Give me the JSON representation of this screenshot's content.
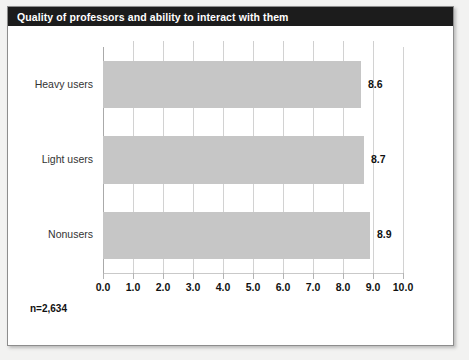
{
  "title": "Quality of professors and ability to interact with them",
  "footnote": "n=2,634",
  "colors": {
    "title_bar_bg": "#1c1c1c",
    "title_text": "#ffffff",
    "bar_fill": "#c6c6c6",
    "gridline": "#d2d2d2",
    "card_bg": "#ffffff",
    "page_bg": "#f2f2f1"
  },
  "chart_data": {
    "type": "bar",
    "orientation": "horizontal",
    "title": "Quality of professors and ability to interact with them",
    "categories": [
      "Heavy users",
      "Light users",
      "Nonusers"
    ],
    "values": [
      8.6,
      8.7,
      8.9
    ],
    "value_labels": [
      "8.6",
      "8.7",
      "8.9"
    ],
    "xlabel": "",
    "ylabel": "",
    "xlim": [
      0.0,
      10.0
    ],
    "xticks": [
      0.0,
      1.0,
      2.0,
      3.0,
      4.0,
      5.0,
      6.0,
      7.0,
      8.0,
      9.0,
      10.0
    ],
    "xtick_labels": [
      "0.0",
      "1.0",
      "2.0",
      "3.0",
      "4.0",
      "5.0",
      "6.0",
      "7.0",
      "8.0",
      "9.0",
      "10.0"
    ],
    "grid": true,
    "grid_axis": "x",
    "legend": false,
    "annotations": [
      "n=2,634"
    ]
  }
}
